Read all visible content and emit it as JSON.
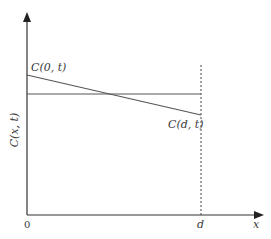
{
  "diagram": {
    "y_axis_label": "C(x, t)",
    "x_axis_label": "x",
    "origin_label": "0",
    "d_label": "d",
    "curve_start_label": "C(0, t)",
    "curve_end_label": "C(d, t)",
    "elements": {
      "horizontal_line": "constant concentration level",
      "sloped_line": "linear concentration profile from C(0, t) to C(d, t)",
      "dashed_line": "boundary at x = d"
    },
    "colors": {
      "axis": "#333333",
      "line": "#555555",
      "text": "#3a3a3a"
    }
  }
}
